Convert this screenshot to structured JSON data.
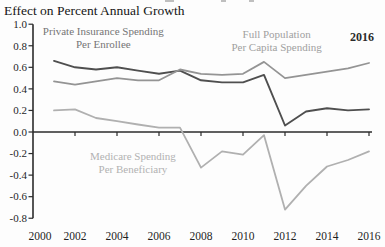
{
  "page": {
    "title": "Effect on Percent Annual Growth"
  },
  "chart_data": {
    "type": "line",
    "title": "Effect on Percent Annual Growth",
    "xlabel": "",
    "ylabel": "",
    "xlim": [
      2000,
      2016.4
    ],
    "ylim": [
      -0.8,
      1.0
    ],
    "grid": false,
    "legend_position": "in-plot-text-labels",
    "axis_color": "#2b2b2b",
    "tick_label_color": "#1f1f1f",
    "x_ticks": [
      2000,
      2002,
      2004,
      2006,
      2008,
      2010,
      2012,
      2014,
      2016
    ],
    "x_tick_labels": [
      "2000",
      "2002",
      "2004",
      "2006",
      "2008",
      "2010",
      "2012",
      "2014",
      "2016"
    ],
    "y_ticks": [
      1.0,
      0.8,
      0.6,
      0.4,
      0.2,
      0.0,
      -0.2,
      -0.4,
      -0.6,
      -0.8
    ],
    "y_tick_labels": [
      "1.0",
      "0.8",
      "0.6",
      "0.4",
      "0.2",
      "0.0",
      "-0.2",
      "-0.4",
      "-0.6",
      "-0.8"
    ],
    "x": [
      2001,
      2002,
      2003,
      2004,
      2005,
      2006,
      2007,
      2008,
      2009,
      2010,
      2011,
      2012,
      2013,
      2014,
      2015,
      2016
    ],
    "series": [
      {
        "name": "Private Insurance Spending Per Enrollee",
        "color": "#4f4f4f",
        "width": 1.9,
        "values": [
          0.66,
          0.6,
          0.58,
          0.6,
          0.57,
          0.54,
          0.57,
          0.48,
          0.46,
          0.46,
          0.53,
          0.06,
          0.19,
          0.22,
          0.2,
          0.21
        ]
      },
      {
        "name": "Full Population Per Capita Spending",
        "color": "#949494",
        "width": 1.8,
        "values": [
          0.47,
          0.44,
          0.47,
          0.5,
          0.48,
          0.48,
          0.58,
          0.54,
          0.53,
          0.54,
          0.65,
          0.5,
          0.53,
          0.56,
          0.59,
          0.64
        ]
      },
      {
        "name": "Medicare Spending Per Beneficiary",
        "color": "#b0b0b0",
        "width": 1.8,
        "values": [
          0.2,
          0.21,
          0.13,
          0.1,
          0.07,
          0.04,
          0.04,
          -0.33,
          -0.18,
          -0.21,
          -0.03,
          -0.72,
          -0.5,
          -0.32,
          -0.26,
          -0.18
        ]
      }
    ],
    "annotations": [
      {
        "id": "label-private-insurance",
        "text_lines": [
          "Private Insurance Spending",
          "Per Enrollee"
        ],
        "x_year": 2003.35,
        "y_value": 0.9,
        "color": "#757575",
        "font_size": 11,
        "bold": false
      },
      {
        "id": "label-full-population",
        "text_lines": [
          "Full Population",
          "Per Capita Spending"
        ],
        "x_year": 2011.6,
        "y_value": 0.87,
        "color": "#a0a0a0",
        "font_size": 11,
        "bold": false
      },
      {
        "id": "label-medicare",
        "text_lines": [
          "Medicare Spending",
          "Per Beneficiary"
        ],
        "x_year": 2004.76,
        "y_value": -0.26,
        "color": "#b2b2b2",
        "font_size": 11,
        "bold": false
      },
      {
        "id": "endpoint-year-label",
        "text_lines": [
          "2016"
        ],
        "x_year": 2015.67,
        "y_value": 0.84,
        "color": "#2b2b2b",
        "font_size": 12,
        "bold": true
      }
    ]
  }
}
